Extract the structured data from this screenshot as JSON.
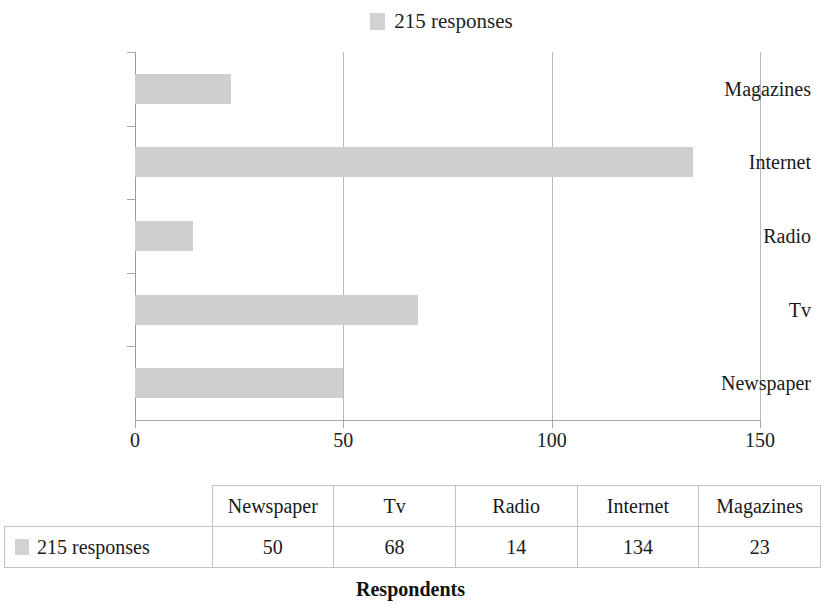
{
  "legend": {
    "series_label": "215 responses",
    "swatch_icon": "legend-color-swatch",
    "swatch_color": "#cfcfcf"
  },
  "axis_title": "Respondents",
  "x_axis": {
    "ticks": [
      "0",
      "50",
      "100",
      "150"
    ],
    "min": 0,
    "max": 150
  },
  "categories_top_to_bottom": [
    "Magazines",
    "Internet",
    "Radio",
    "Tv",
    "Newspaper"
  ],
  "table": {
    "row_header_label": "215 responses",
    "columns": [
      "Newspaper",
      "Tv",
      "Radio",
      "Internet",
      "Magazines"
    ],
    "values": [
      "50",
      "68",
      "14",
      "134",
      "23"
    ]
  },
  "chart_data": {
    "type": "bar",
    "orientation": "horizontal",
    "title": "",
    "subtitle": "",
    "xlabel": "Respondents",
    "ylabel": "",
    "categories": [
      "Newspaper",
      "Tv",
      "Radio",
      "Internet",
      "Magazines"
    ],
    "series": [
      {
        "name": "215 responses",
        "values": [
          50,
          68,
          14,
          134,
          23
        ],
        "color": "#cfcfcf"
      }
    ],
    "xlim": [
      0,
      150
    ],
    "xticks": [
      0,
      50,
      100,
      150
    ],
    "grid": true,
    "grid_axis": "x",
    "legend_position": "top-center",
    "annotations": []
  }
}
